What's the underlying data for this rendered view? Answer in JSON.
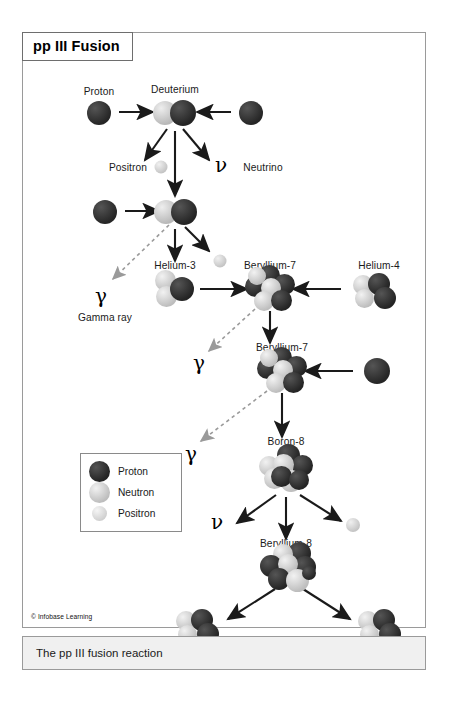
{
  "figure": {
    "title": "pp III Fusion",
    "credit": "© Infobase Learning",
    "caption": "The pp III fusion reaction"
  },
  "colors": {
    "proton": "#2f2f2f",
    "neutron": "#c9c9c9",
    "positron": "#d4d4d4",
    "arrow": "#1a1a1a",
    "gamma_arrow": "#9a9a9a",
    "frame": "#9a9a9a",
    "caption_bg": "#f0f0f0"
  },
  "legend": {
    "items": [
      {
        "label": "Proton",
        "type": "proton"
      },
      {
        "label": "Neutron",
        "type": "neutron"
      },
      {
        "label": "Positron",
        "type": "positron"
      }
    ]
  },
  "labels": {
    "proton": "Proton",
    "deuterium": "Deuterium",
    "positron": "Positron",
    "neutrino": "Neutrino",
    "helium3": "Helium-3",
    "beryllium7_a": "Beryllium-7",
    "beryllium7_b": "Beryllium-7",
    "helium4": "Helium-4",
    "boron8": "Boron-8",
    "beryllium8": "Beryllium-8",
    "gamma_ray": "Gamma ray"
  },
  "symbols": {
    "gamma": "γ",
    "nu": "ν"
  },
  "chain": {
    "steps": [
      {
        "id": "s1",
        "reactants": [
          "proton",
          "proton"
        ],
        "products": [
          "deuterium",
          "positron",
          "neutrino"
        ]
      },
      {
        "id": "s2",
        "reactants": [
          "deuterium",
          "proton"
        ],
        "products": [
          "helium-3",
          "gamma",
          "positron"
        ]
      },
      {
        "id": "s3",
        "reactants": [
          "helium-3",
          "helium-4"
        ],
        "products": [
          "beryllium-7",
          "gamma"
        ]
      },
      {
        "id": "s4",
        "reactants": [
          "beryllium-7",
          "proton"
        ],
        "products": [
          "boron-8",
          "gamma"
        ]
      },
      {
        "id": "s5",
        "reactants": [
          "boron-8"
        ],
        "products": [
          "beryllium-8",
          "neutrino",
          "positron"
        ]
      },
      {
        "id": "s6",
        "reactants": [
          "beryllium-8"
        ],
        "products": [
          "helium-4",
          "helium-4"
        ]
      }
    ]
  }
}
